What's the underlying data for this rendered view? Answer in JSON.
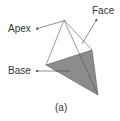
{
  "labels": {
    "apex": "Apex",
    "face": "Face",
    "base": "Base",
    "caption": "(a)"
  },
  "colors": {
    "base_fill": "#8c8c8c",
    "edge": "#555555",
    "text": "#333333"
  },
  "shape": {
    "type": "pyramid",
    "vertices": {
      "apex": [
        64,
        20
      ],
      "base_left": [
        46,
        65
      ],
      "base_right": [
        92,
        50
      ],
      "base_bottom": [
        98,
        95
      ]
    }
  }
}
